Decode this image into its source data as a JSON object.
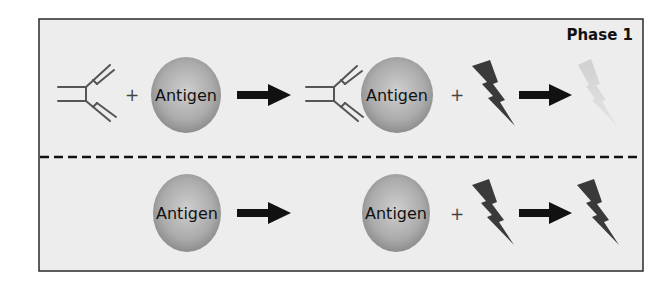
{
  "diagram": {
    "phase_label": "Phase 1",
    "top_row": {
      "description": "Antibody + Antigen -> Antibody-bound Antigen + bolt -> faded bolt",
      "antigen_1_label": "Antigen",
      "antigen_2_label": "Antigen",
      "plus_1": "+",
      "plus_2": "+"
    },
    "bottom_row": {
      "description": "Antigen -> Antigen + bolt -> bolt",
      "antigen_1_label": "Antigen",
      "antigen_2_label": "Antigen",
      "plus_1": "+"
    },
    "icons": [
      "antibody-icon",
      "antigen-sphere",
      "arrow-right-icon",
      "lightning-bolt-icon",
      "faded-lightning-bolt-icon",
      "dashed-divider"
    ],
    "colors": {
      "panel_bg": "#ececec",
      "border": "#2a2a2a",
      "sphere_light": "#c4c4c4",
      "sphere_dark": "#8a8a8a",
      "bolt": "#3a3a3a",
      "bolt_faded": "#d6d6d6",
      "arrow": "#111111"
    }
  }
}
